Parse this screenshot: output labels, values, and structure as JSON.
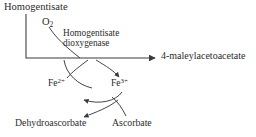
{
  "diagram": {
    "type": "biochemical-pathway",
    "stroke_color": "#3a3a3a",
    "text_color": "#2b2b2b",
    "background_color": "#ffffff"
  },
  "labels": {
    "substrate": "Homogentisate",
    "cosubstrate_formula": "O",
    "cosubstrate_subscript": "2",
    "enzyme_line1": "Homogentisate",
    "enzyme_line2": "dioxygenase",
    "product": "4-maleylacetoacetate",
    "iron_reduced_symbol": "Fe",
    "iron_reduced_charge": "2+",
    "iron_oxidized_symbol": "Fe",
    "iron_oxidized_charge": "3+",
    "dehydroascorbate": "Dehydroascorbate",
    "ascorbate": "Ascorbate"
  }
}
